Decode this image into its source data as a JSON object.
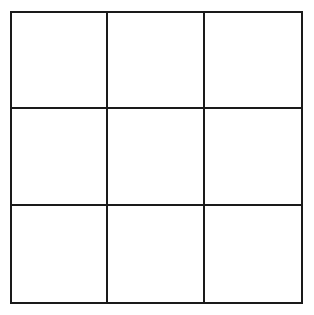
{
  "board": {
    "rows": 3,
    "cols": 3,
    "line_color": "#1a1a1a",
    "cells": [
      "",
      "",
      "",
      "",
      "",
      "",
      "",
      "",
      ""
    ]
  }
}
